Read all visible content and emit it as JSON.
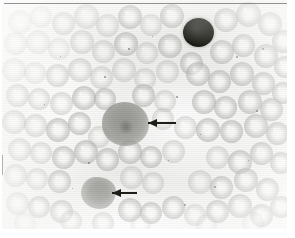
{
  "figure": {
    "kind": "light-microscopy-photomicrograph",
    "specimen": "peripheral blood smear",
    "modality": "brightfield",
    "rendering": "grayscale",
    "width_px": 295,
    "height_px": 238,
    "caption_text": "",
    "visible_text": [],
    "background_color": "#f2f2f0",
    "border_color": "#3c3c38"
  },
  "annotations": {
    "arrows": [
      {
        "id": "arrow-upper",
        "label": "",
        "direction": "left",
        "color": "#1d1d1a",
        "x": 148,
        "y": 122,
        "length_px": 28,
        "points_to": "large-arrowed-cell"
      },
      {
        "id": "arrow-lower",
        "label": "",
        "direction": "left",
        "color": "#1d1d1a",
        "x": 112,
        "y": 192,
        "length_px": 25,
        "points_to": "lower-arrowed-cell"
      }
    ]
  },
  "cells": {
    "dark_nucleated_cell": {
      "name": "dark-stained-nucleated-cell",
      "x": 183,
      "y": 18,
      "width": 31,
      "height": 29,
      "color": "#18180f",
      "description": "densely stained round dark cell, upper right field"
    },
    "large_arrowed_cell": {
      "name": "large-arrowed-cell",
      "x": 102,
      "y": 102,
      "width": 47,
      "height": 44,
      "color": "#8b8b87",
      "description": "enlarged grey cell with mottled interior, centre of field"
    },
    "lower_arrowed_cell": {
      "name": "lower-arrowed-cell",
      "x": 81,
      "y": 177,
      "width": 35,
      "height": 32,
      "color": "#92928e",
      "description": "irregular grey cell, lower left-centre of field"
    },
    "erythrocyte_color": "#b0b0ad",
    "erythrocyte_pallor_color": "#fafaf8",
    "erythrocytes": [
      {
        "x": 8,
        "y": 10,
        "d": 24,
        "tone": "faint"
      },
      {
        "x": 30,
        "y": 6,
        "d": 22,
        "tone": "faint"
      },
      {
        "x": 52,
        "y": 12,
        "d": 23,
        "tone": "pale"
      },
      {
        "x": 74,
        "y": 4,
        "d": 25,
        "tone": "pale"
      },
      {
        "x": 96,
        "y": 14,
        "d": 23,
        "tone": "pale"
      },
      {
        "x": 118,
        "y": 5,
        "d": 24,
        "tone": "mid"
      },
      {
        "x": 140,
        "y": 14,
        "d": 22,
        "tone": "pale"
      },
      {
        "x": 160,
        "y": 4,
        "d": 24,
        "tone": "mid"
      },
      {
        "x": 214,
        "y": 8,
        "d": 24,
        "tone": "mid"
      },
      {
        "x": 236,
        "y": 2,
        "d": 25,
        "tone": "mid"
      },
      {
        "x": 258,
        "y": 12,
        "d": 24,
        "tone": "mid"
      },
      {
        "x": 272,
        "y": 30,
        "d": 23,
        "tone": "mid"
      },
      {
        "x": 4,
        "y": 32,
        "d": 23,
        "tone": "faint"
      },
      {
        "x": 26,
        "y": 30,
        "d": 24,
        "tone": "faint"
      },
      {
        "x": 48,
        "y": 38,
        "d": 22,
        "tone": "faint"
      },
      {
        "x": 70,
        "y": 30,
        "d": 24,
        "tone": "pale"
      },
      {
        "x": 92,
        "y": 40,
        "d": 23,
        "tone": "pale"
      },
      {
        "x": 114,
        "y": 32,
        "d": 24,
        "tone": "mid"
      },
      {
        "x": 136,
        "y": 42,
        "d": 22,
        "tone": "pale"
      },
      {
        "x": 158,
        "y": 34,
        "d": 24,
        "tone": "mid"
      },
      {
        "x": 180,
        "y": 52,
        "d": 23,
        "tone": "mid"
      },
      {
        "x": 210,
        "y": 40,
        "d": 24,
        "tone": "mid"
      },
      {
        "x": 232,
        "y": 34,
        "d": 23,
        "tone": "mid"
      },
      {
        "x": 254,
        "y": 44,
        "d": 24,
        "tone": "mid"
      },
      {
        "x": 274,
        "y": 56,
        "d": 22,
        "tone": "mid"
      },
      {
        "x": 2,
        "y": 58,
        "d": 24,
        "tone": "faint"
      },
      {
        "x": 24,
        "y": 62,
        "d": 22,
        "tone": "faint"
      },
      {
        "x": 46,
        "y": 64,
        "d": 23,
        "tone": "pale"
      },
      {
        "x": 68,
        "y": 58,
        "d": 24,
        "tone": "pale"
      },
      {
        "x": 90,
        "y": 66,
        "d": 23,
        "tone": "pale"
      },
      {
        "x": 112,
        "y": 58,
        "d": 24,
        "tone": "pale"
      },
      {
        "x": 134,
        "y": 68,
        "d": 22,
        "tone": "pale"
      },
      {
        "x": 156,
        "y": 60,
        "d": 23,
        "tone": "pale"
      },
      {
        "x": 186,
        "y": 62,
        "d": 24,
        "tone": "mid"
      },
      {
        "x": 208,
        "y": 70,
        "d": 23,
        "tone": "mid"
      },
      {
        "x": 230,
        "y": 62,
        "d": 24,
        "tone": "mid"
      },
      {
        "x": 252,
        "y": 72,
        "d": 23,
        "tone": "mid"
      },
      {
        "x": 272,
        "y": 82,
        "d": 22,
        "tone": "mid"
      },
      {
        "x": 6,
        "y": 84,
        "d": 23,
        "tone": "pale"
      },
      {
        "x": 28,
        "y": 88,
        "d": 22,
        "tone": "pale"
      },
      {
        "x": 50,
        "y": 92,
        "d": 23,
        "tone": "pale"
      },
      {
        "x": 72,
        "y": 86,
        "d": 24,
        "tone": "mid"
      },
      {
        "x": 94,
        "y": 88,
        "d": 22,
        "tone": "mid"
      },
      {
        "x": 132,
        "y": 84,
        "d": 23,
        "tone": "mid"
      },
      {
        "x": 154,
        "y": 90,
        "d": 22,
        "tone": "pale"
      },
      {
        "x": 192,
        "y": 90,
        "d": 24,
        "tone": "mid"
      },
      {
        "x": 214,
        "y": 96,
        "d": 23,
        "tone": "mid"
      },
      {
        "x": 238,
        "y": 90,
        "d": 24,
        "tone": "mid"
      },
      {
        "x": 260,
        "y": 98,
        "d": 23,
        "tone": "mid"
      },
      {
        "x": 2,
        "y": 110,
        "d": 24,
        "tone": "pale"
      },
      {
        "x": 24,
        "y": 114,
        "d": 23,
        "tone": "pale"
      },
      {
        "x": 46,
        "y": 118,
        "d": 24,
        "tone": "mid"
      },
      {
        "x": 68,
        "y": 112,
        "d": 23,
        "tone": "mid"
      },
      {
        "x": 88,
        "y": 126,
        "d": 22,
        "tone": "pale"
      },
      {
        "x": 152,
        "y": 108,
        "d": 22,
        "tone": "pale"
      },
      {
        "x": 174,
        "y": 116,
        "d": 23,
        "tone": "pale"
      },
      {
        "x": 196,
        "y": 118,
        "d": 24,
        "tone": "mid"
      },
      {
        "x": 220,
        "y": 120,
        "d": 23,
        "tone": "mid"
      },
      {
        "x": 244,
        "y": 114,
        "d": 24,
        "tone": "mid"
      },
      {
        "x": 266,
        "y": 122,
        "d": 23,
        "tone": "mid"
      },
      {
        "x": 8,
        "y": 138,
        "d": 23,
        "tone": "pale"
      },
      {
        "x": 30,
        "y": 142,
        "d": 22,
        "tone": "pale"
      },
      {
        "x": 52,
        "y": 146,
        "d": 23,
        "tone": "mid"
      },
      {
        "x": 74,
        "y": 140,
        "d": 24,
        "tone": "mid"
      },
      {
        "x": 96,
        "y": 148,
        "d": 23,
        "tone": "mid"
      },
      {
        "x": 118,
        "y": 140,
        "d": 24,
        "tone": "mid"
      },
      {
        "x": 140,
        "y": 146,
        "d": 22,
        "tone": "mid"
      },
      {
        "x": 162,
        "y": 140,
        "d": 23,
        "tone": "pale"
      },
      {
        "x": 206,
        "y": 146,
        "d": 23,
        "tone": "pale"
      },
      {
        "x": 228,
        "y": 150,
        "d": 24,
        "tone": "mid"
      },
      {
        "x": 250,
        "y": 142,
        "d": 23,
        "tone": "mid"
      },
      {
        "x": 270,
        "y": 152,
        "d": 22,
        "tone": "mid"
      },
      {
        "x": 4,
        "y": 164,
        "d": 23,
        "tone": "pale"
      },
      {
        "x": 26,
        "y": 168,
        "d": 22,
        "tone": "pale"
      },
      {
        "x": 48,
        "y": 170,
        "d": 23,
        "tone": "mid"
      },
      {
        "x": 120,
        "y": 166,
        "d": 23,
        "tone": "pale"
      },
      {
        "x": 142,
        "y": 172,
        "d": 22,
        "tone": "pale"
      },
      {
        "x": 188,
        "y": 170,
        "d": 24,
        "tone": "pale"
      },
      {
        "x": 210,
        "y": 176,
        "d": 23,
        "tone": "mid"
      },
      {
        "x": 234,
        "y": 168,
        "d": 24,
        "tone": "mid"
      },
      {
        "x": 256,
        "y": 178,
        "d": 23,
        "tone": "mid"
      },
      {
        "x": 6,
        "y": 192,
        "d": 23,
        "tone": "pale"
      },
      {
        "x": 28,
        "y": 196,
        "d": 22,
        "tone": "mid"
      },
      {
        "x": 50,
        "y": 200,
        "d": 23,
        "tone": "mid"
      },
      {
        "x": 118,
        "y": 198,
        "d": 24,
        "tone": "mid"
      },
      {
        "x": 140,
        "y": 202,
        "d": 22,
        "tone": "mid"
      },
      {
        "x": 162,
        "y": 196,
        "d": 23,
        "tone": "mid"
      },
      {
        "x": 184,
        "y": 204,
        "d": 22,
        "tone": "pale"
      },
      {
        "x": 206,
        "y": 200,
        "d": 23,
        "tone": "mid"
      },
      {
        "x": 228,
        "y": 194,
        "d": 24,
        "tone": "mid"
      },
      {
        "x": 250,
        "y": 204,
        "d": 23,
        "tone": "mid"
      },
      {
        "x": 270,
        "y": 196,
        "d": 22,
        "tone": "mid"
      },
      {
        "x": 14,
        "y": 212,
        "d": 22,
        "tone": "faint"
      },
      {
        "x": 60,
        "y": 210,
        "d": 22,
        "tone": "pale"
      },
      {
        "x": 92,
        "y": 212,
        "d": 22,
        "tone": "pale"
      },
      {
        "x": 130,
        "y": 214,
        "d": 21,
        "tone": "faint"
      },
      {
        "x": 196,
        "y": 214,
        "d": 21,
        "tone": "faint"
      },
      {
        "x": 242,
        "y": 212,
        "d": 22,
        "tone": "faint"
      }
    ],
    "specks": [
      {
        "x": 128,
        "y": 48,
        "d": 2
      },
      {
        "x": 152,
        "y": 36,
        "d": 1
      },
      {
        "x": 176,
        "y": 96,
        "d": 2
      },
      {
        "x": 200,
        "y": 134,
        "d": 1
      },
      {
        "x": 236,
        "y": 56,
        "d": 2
      },
      {
        "x": 262,
        "y": 48,
        "d": 2
      },
      {
        "x": 44,
        "y": 104,
        "d": 1
      },
      {
        "x": 88,
        "y": 162,
        "d": 2
      },
      {
        "x": 168,
        "y": 160,
        "d": 1
      },
      {
        "x": 214,
        "y": 186,
        "d": 2
      },
      {
        "x": 60,
        "y": 56,
        "d": 1
      },
      {
        "x": 104,
        "y": 76,
        "d": 2
      },
      {
        "x": 248,
        "y": 160,
        "d": 1
      },
      {
        "x": 184,
        "y": 204,
        "d": 2
      },
      {
        "x": 72,
        "y": 188,
        "d": 1
      },
      {
        "x": 256,
        "y": 110,
        "d": 2
      }
    ]
  }
}
